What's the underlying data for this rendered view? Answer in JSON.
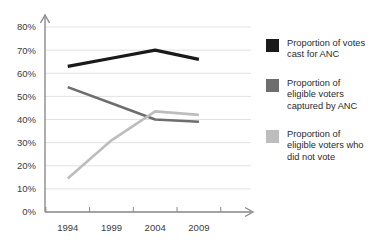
{
  "chart_data": {
    "type": "line",
    "title": "",
    "subtitle": "",
    "xlabel": "",
    "ylabel": "",
    "x": [
      "1994",
      "1999",
      "2004",
      "2009"
    ],
    "categories": [
      "1994",
      "1999",
      "2004",
      "2009"
    ],
    "ylim": [
      0,
      80
    ],
    "xlim": [
      1994,
      2009
    ],
    "ytick_labels": [
      "0%",
      "10%",
      "20%",
      "30%",
      "40%",
      "50%",
      "60%",
      "70%",
      "80%"
    ],
    "ytick_values": [
      0,
      10,
      20,
      30,
      40,
      50,
      60,
      70,
      80
    ],
    "xtick_labels": [
      "1994",
      "1999",
      "2004",
      "2009"
    ],
    "grid": "horizontal",
    "legend_position": "right",
    "axis_arrows": true,
    "series": [
      {
        "name": "Proportion of votes cast for ANC",
        "color": "#1a1a1a",
        "width": 3.2,
        "values": [
          63,
          66.5,
          70,
          66
        ]
      },
      {
        "name": "Proportion of eligible voters captured by ANC",
        "color": "#6e6e6e",
        "width": 2.6,
        "values": [
          54,
          47,
          40,
          39
        ]
      },
      {
        "name": "Proportion of eligible voters who did not vote",
        "color": "#bdbdbd",
        "width": 2.6,
        "values": [
          14.5,
          31,
          43.5,
          42
        ]
      }
    ]
  },
  "axes": {
    "y_ticks": [
      {
        "label": "80%",
        "value": 80
      },
      {
        "label": "70%",
        "value": 70
      },
      {
        "label": "60%",
        "value": 60
      },
      {
        "label": "50%",
        "value": 50
      },
      {
        "label": "40%",
        "value": 40
      },
      {
        "label": "30%",
        "value": 30
      },
      {
        "label": "20%",
        "value": 20
      },
      {
        "label": "10%",
        "value": 10
      },
      {
        "label": "0%",
        "value": 0
      }
    ],
    "x_ticks": [
      {
        "label": "1994",
        "value": 1994
      },
      {
        "label": "1999",
        "value": 1999
      },
      {
        "label": "2004",
        "value": 2004
      },
      {
        "label": "2009",
        "value": 2009
      }
    ],
    "axis_color": "#8a8a8a",
    "grid_color": "#e2e2e2",
    "tick_text_color": "#3c3c3c"
  },
  "legend": {
    "entries": [
      {
        "label": "Proportion of votes\ncast for ANC",
        "color": "#1a1a1a"
      },
      {
        "label": "Proportion of\neligible voters\ncaptured by ANC",
        "color": "#6e6e6e"
      },
      {
        "label": "Proportion of\neligible voters who\ndid not vote",
        "color": "#bdbdbd"
      }
    ]
  }
}
